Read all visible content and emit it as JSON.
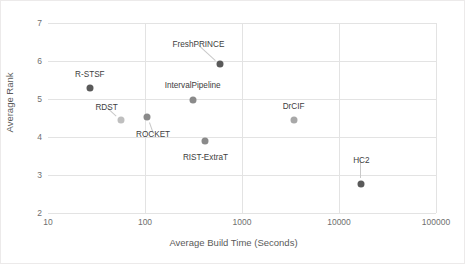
{
  "chart_data": {
    "type": "scatter",
    "title": "",
    "xlabel": "Average Build Time (Seconds)",
    "ylabel": "Average Rank",
    "xscale": "log",
    "xlim": [
      10,
      100000
    ],
    "ylim": [
      2,
      7
    ],
    "xticks": [
      "10",
      "100",
      "1000",
      "10000",
      "100000"
    ],
    "yticks": [
      "2",
      "3",
      "4",
      "5",
      "6",
      "7"
    ],
    "grid": true,
    "legend": "none",
    "points": [
      {
        "label": "R-STSF",
        "x": 27,
        "y": 5.28,
        "color": "#5a5a5a",
        "marker": "dark"
      },
      {
        "label": "RDST",
        "x": 56,
        "y": 4.45,
        "color": "#bfbfbf",
        "marker": "light"
      },
      {
        "label": "ROCKET",
        "x": 105,
        "y": 4.52,
        "color": "#8a8a8a",
        "marker": "dark"
      },
      {
        "label": "IntervalPipeline",
        "x": 310,
        "y": 4.98,
        "color": "#8a8a8a",
        "marker": "dark"
      },
      {
        "label": "FreshPRINCE",
        "x": 600,
        "y": 5.92,
        "color": "#5a5a5a",
        "marker": "dark"
      },
      {
        "label": "RIST-ExtraT",
        "x": 420,
        "y": 3.9,
        "color": "#8a8a8a",
        "marker": "dark"
      },
      {
        "label": "DrCIF",
        "x": 3400,
        "y": 4.44,
        "color": "#a8a8a8",
        "marker": "light"
      },
      {
        "label": "HC2",
        "x": 17000,
        "y": 2.77,
        "color": "#5a5a5a",
        "marker": "dark"
      }
    ]
  },
  "colors": {
    "grid": "#e3e3e3",
    "axis": "#d9d9d9",
    "tick_text": "#6f6f6f",
    "axis_title": "#5a5a5a",
    "point_dark": "#5a5a5a",
    "point_light": "#bfbfbf",
    "leader": "#c9c9c9",
    "frame": "#eceaea"
  }
}
